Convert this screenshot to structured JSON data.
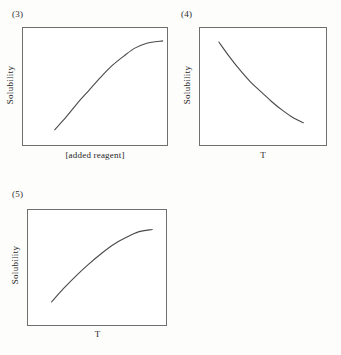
{
  "figure": {
    "background_color": "#fdfdfc",
    "line_color": "#4a4a4a",
    "box_border_color": "#6f6f6f"
  },
  "panels": [
    {
      "tag": "(3)",
      "ylabel": "Solubility",
      "xlabel": "[added reagent]"
    },
    {
      "tag": "(4)",
      "ylabel": "Solubility",
      "xlabel": "T"
    },
    {
      "tag": "(5)",
      "ylabel": "Solubility",
      "xlabel": "T"
    }
  ],
  "chart_data": [
    {
      "type": "line",
      "title": "(3)",
      "xlabel": "[added reagent]",
      "ylabel": "Solubility",
      "xlim": [
        0,
        1
      ],
      "ylim": [
        0,
        1
      ],
      "grid": false,
      "legend": null,
      "axis_ticks": false,
      "shape": "increasing concave saturating",
      "series": [
        {
          "name": "solubility vs added reagent",
          "x": [
            0.22,
            0.3,
            0.38,
            0.46,
            0.54,
            0.62,
            0.7,
            0.78,
            0.86,
            0.97
          ],
          "y": [
            0.13,
            0.24,
            0.36,
            0.47,
            0.58,
            0.68,
            0.76,
            0.83,
            0.87,
            0.89
          ]
        }
      ]
    },
    {
      "type": "line",
      "title": "(4)",
      "xlabel": "T",
      "ylabel": "Solubility",
      "xlim": [
        0,
        1
      ],
      "ylim": [
        0,
        1
      ],
      "grid": false,
      "legend": null,
      "axis_ticks": false,
      "shape": "decreasing convex decay",
      "series": [
        {
          "name": "solubility vs temperature (exothermic dissolution)",
          "x": [
            0.15,
            0.23,
            0.31,
            0.4,
            0.49,
            0.57,
            0.65,
            0.73,
            0.82
          ],
          "y": [
            0.88,
            0.76,
            0.65,
            0.54,
            0.45,
            0.37,
            0.3,
            0.24,
            0.19
          ]
        }
      ]
    },
    {
      "type": "line",
      "title": "(5)",
      "xlabel": "T",
      "ylabel": "Solubility",
      "xlim": [
        0,
        1
      ],
      "ylim": [
        0,
        1
      ],
      "grid": false,
      "legend": null,
      "axis_ticks": false,
      "shape": "increasing concave",
      "series": [
        {
          "name": "solubility vs temperature (endothermic dissolution)",
          "x": [
            0.17,
            0.26,
            0.35,
            0.44,
            0.53,
            0.62,
            0.71,
            0.8,
            0.9
          ],
          "y": [
            0.2,
            0.32,
            0.43,
            0.53,
            0.62,
            0.7,
            0.76,
            0.81,
            0.83
          ]
        }
      ]
    }
  ]
}
